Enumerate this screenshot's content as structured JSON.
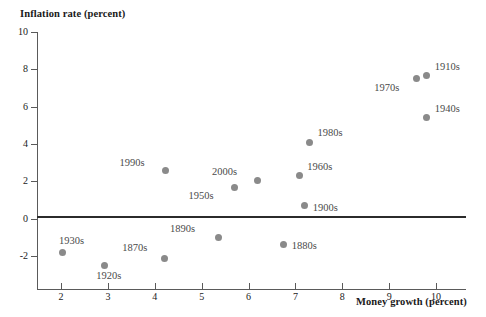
{
  "chart_data": {
    "type": "scatter",
    "title": "",
    "xlabel": "Money growth (percent)",
    "ylabel": "Inflation rate (percent)",
    "xlim": [
      1.3,
      10.45
    ],
    "ylim": [
      -2.9,
      10
    ],
    "xticks": [
      2,
      3,
      4,
      5,
      6,
      7,
      8,
      9,
      10
    ],
    "yticks": [
      10,
      8,
      6,
      4,
      2,
      0,
      -2
    ],
    "grid": false,
    "legend": null,
    "zero_line": 0,
    "points": [
      {
        "label": "1870s",
        "x": 4.2,
        "y": -2.15,
        "label_dx": -42,
        "label_dy": -16
      },
      {
        "label": "1880s",
        "x": 6.75,
        "y": -1.4,
        "label_dx": 8,
        "label_dy": -4
      },
      {
        "label": "1890s",
        "x": 5.35,
        "y": -1.0,
        "label_dx": -48,
        "label_dy": -13
      },
      {
        "label": "1900s",
        "x": 7.2,
        "y": 0.7,
        "label_dx": 8,
        "label_dy": -3
      },
      {
        "label": "1910s",
        "x": 9.8,
        "y": 7.65,
        "label_dx": 8,
        "label_dy": -14
      },
      {
        "label": "1920s",
        "x": 2.92,
        "y": -2.5,
        "label_dx": -8,
        "label_dy": 6
      },
      {
        "label": "1930s",
        "x": 2.04,
        "y": -1.8,
        "label_dx": -4,
        "label_dy": -16
      },
      {
        "label": "1940s",
        "x": 9.8,
        "y": 5.4,
        "label_dx": 8,
        "label_dy": -14
      },
      {
        "label": "1950s",
        "x": 5.7,
        "y": 1.65,
        "label_dx": -46,
        "label_dy": 3
      },
      {
        "label": "1960s",
        "x": 7.08,
        "y": 2.3,
        "label_dx": 8,
        "label_dy": -14
      },
      {
        "label": "1970s",
        "x": 9.58,
        "y": 7.5,
        "label_dx": -42,
        "label_dy": 4
      },
      {
        "label": "1980s",
        "x": 7.3,
        "y": 4.1,
        "label_dx": 8,
        "label_dy": -14
      },
      {
        "label": "1990s",
        "x": 4.23,
        "y": 2.6,
        "label_dx": -46,
        "label_dy": -12
      },
      {
        "label": "2000s",
        "x": 6.2,
        "y": 2.05,
        "label_dx": -46,
        "label_dy": -13
      }
    ]
  }
}
